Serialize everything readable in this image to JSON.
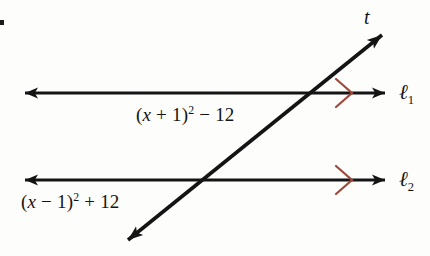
{
  "figure": {
    "type": "geometry-diagram",
    "background_color": "#fdfdfc",
    "line_color": "#141414",
    "tick_mark_color": "#9c4a3a"
  },
  "labels": {
    "expression_upper": {
      "prefix": "(",
      "var": "x",
      "middle": " + 1)",
      "exponent": "2",
      "suffix": " − 12",
      "full_text": "(x + 1)² − 12"
    },
    "expression_lower": {
      "prefix": "(",
      "var": "x",
      "middle": " − 1)",
      "exponent": "2",
      "suffix": " + 12",
      "full_text": "(x − 1)² + 12"
    },
    "line_1": {
      "symbol": "ℓ",
      "subscript": "1"
    },
    "line_2": {
      "symbol": "ℓ",
      "subscript": "2"
    },
    "transversal": "t"
  },
  "geometry": {
    "line_1": {
      "y": 93,
      "x_start": 25,
      "x_end": 385,
      "arrows": "both"
    },
    "line_2": {
      "y": 180,
      "x_start": 25,
      "x_end": 385,
      "arrows": "both"
    },
    "transversal": {
      "x1": 128,
      "y1": 240,
      "x2": 382,
      "y2": 35,
      "arrows": "both"
    },
    "intersection_upper": {
      "x": 302,
      "y": 93
    },
    "intersection_lower": {
      "x": 193,
      "y": 180
    },
    "parallel_mark_1": {
      "x": 348,
      "y": 93
    },
    "parallel_mark_2": {
      "x": 348,
      "y": 180
    }
  }
}
